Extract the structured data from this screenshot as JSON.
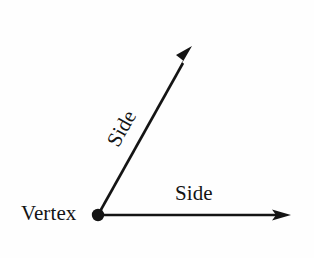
{
  "figure": {
    "type": "geometry-diagram",
    "background_color": "#fefefe",
    "ink_color": "#141414",
    "labels": {
      "vertex": "Vertex",
      "side_horizontal": "Side",
      "side_diagonal": "Side"
    },
    "caption_partial": "",
    "geometry": {
      "vertex_point": [
        98,
        215
      ],
      "vertex_dot_radius": 6,
      "ray_horizontal": {
        "from": [
          98,
          215
        ],
        "to": [
          291,
          215
        ],
        "arrowhead": "filled-triangle",
        "stroke_width": 2.6
      },
      "ray_diagonal": {
        "from": [
          98,
          215
        ],
        "to": [
          192,
          47
        ],
        "arrowhead": "filled-triangle",
        "stroke_width": 2.6,
        "angle_degrees": 60.8
      }
    }
  }
}
